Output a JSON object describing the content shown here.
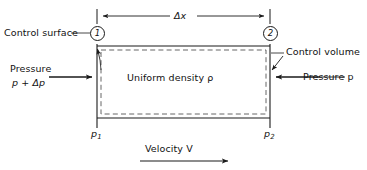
{
  "figure": {
    "background_color": "#ffffff",
    "line_color": "#1a1a1a",
    "dashed_color": "#555555"
  },
  "labels": {
    "control_surface": "Control surface",
    "control_volume": "Control volume",
    "delta_x": "Δx",
    "uniform_density": "Uniform density ρ",
    "pressure_left_line1": "Pressure",
    "pressure_left_line2": "p + Δp",
    "pressure_right": "Pressure p",
    "velocity": "Velocity V",
    "station_1": "1",
    "station_2": "2",
    "p1_base": "p",
    "p1_sub": "1",
    "p2_base": "p",
    "p2_sub": "2"
  },
  "geometry": {
    "box_left_x": 97,
    "box_right_x": 270,
    "box_top_y": 46,
    "box_bottom_y": 118,
    "dim_line_y": 16,
    "velocity_arrow_y": 160,
    "delta_x_value_label": "Δx"
  }
}
